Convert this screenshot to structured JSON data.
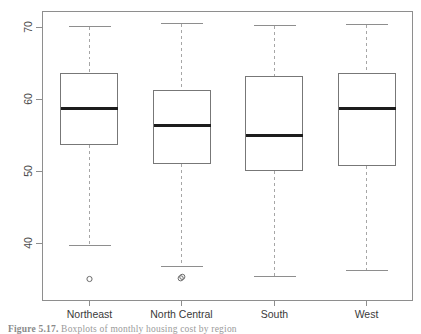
{
  "figure": {
    "caption_prefix": "Figure",
    "caption_number": "5.17",
    "caption_text": "Boxplots of monthly housing cost by region"
  },
  "axis": {
    "y_ticks": [
      "40",
      "50",
      "60",
      "70"
    ],
    "y_tick_values": [
      40,
      50,
      60,
      70
    ],
    "x_categories": [
      "Northeast",
      "North Central",
      "South",
      "West"
    ]
  },
  "chart_data": {
    "type": "box",
    "title": "",
    "xlabel": "",
    "ylabel": "",
    "ylim": [
      33.5,
      72.5
    ],
    "grid": false,
    "legend": null,
    "categories": [
      "Northeast",
      "North Central",
      "South",
      "West"
    ],
    "y_tick_labels": [
      "40",
      "50",
      "60",
      "70"
    ],
    "y_tick_positions": [
      40,
      50,
      60,
      70
    ],
    "boxes": [
      {
        "category": "Northeast",
        "whisker_low": 39.7,
        "q1": 53.8,
        "median": 58.8,
        "q3": 63.6,
        "whisker_high": 70.2,
        "outliers": [
          35.0
        ]
      },
      {
        "category": "North Central",
        "whisker_low": 36.8,
        "q1": 51.1,
        "median": 56.4,
        "q3": 61.3,
        "whisker_high": 70.6,
        "outliers": [
          35.1,
          35.3
        ]
      },
      {
        "category": "South",
        "whisker_low": 35.4,
        "q1": 50.1,
        "median": 55.0,
        "q3": 63.2,
        "whisker_high": 70.3,
        "outliers": []
      },
      {
        "category": "West",
        "whisker_low": 36.3,
        "q1": 50.9,
        "median": 58.7,
        "q3": 63.6,
        "whisker_high": 70.4,
        "outliers": []
      }
    ]
  }
}
